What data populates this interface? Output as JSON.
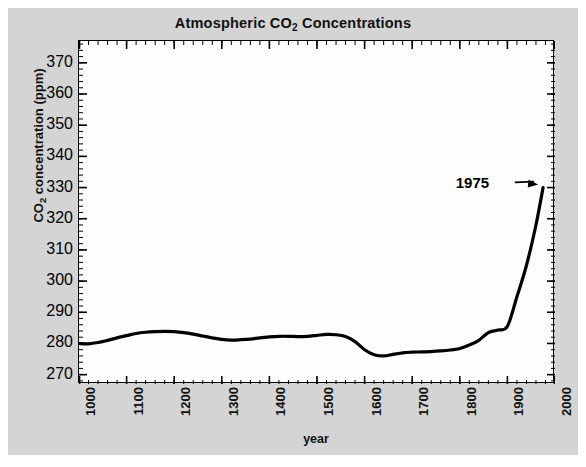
{
  "figure": {
    "background_color": "#d4d4d4",
    "plot_background_color": "#fdfdfd",
    "line_color": "#000000",
    "text_color": "#111111"
  },
  "title": {
    "prefix": "Atmospheric CO",
    "subscript": "2",
    "suffix": " Concentrations",
    "full": "Atmospheric CO2 Concentrations"
  },
  "ylabel": {
    "prefix": "CO",
    "subscript": "2",
    "suffix": " concentration (ppm)",
    "full": "CO2 concentration (ppm)"
  },
  "xlabel": "year",
  "annotation": {
    "label": "1975"
  },
  "chart_data": {
    "type": "line",
    "title": "Atmospheric CO2 Concentrations",
    "xlabel": "year",
    "ylabel": "CO2 concentration (ppm)",
    "xlim": [
      1000,
      2000
    ],
    "ylim": [
      267,
      377
    ],
    "xticks": [
      1000,
      1100,
      1200,
      1300,
      1400,
      1500,
      1600,
      1700,
      1800,
      1900,
      2000
    ],
    "xtick_labels": [
      "1000",
      "1100",
      "1200",
      "1300",
      "1400",
      "1500",
      "1600",
      "1700",
      "1800",
      "1900",
      "2000"
    ],
    "yticks": [
      270,
      280,
      290,
      300,
      310,
      320,
      330,
      340,
      350,
      360,
      370
    ],
    "ytick_labels": [
      "270",
      "280",
      "290",
      "300",
      "310",
      "320",
      "330",
      "340",
      "350",
      "360",
      "370"
    ],
    "minor_tick_interval_x": 20,
    "minor_tick_interval_y": 2,
    "grid": false,
    "legend": false,
    "line_width": 3.2,
    "annotations": [
      {
        "text": "1975",
        "text_x": 1905,
        "text_y": 331,
        "arrow_to_x": 1973,
        "arrow_to_y": 330
      }
    ],
    "series": [
      {
        "name": "CO2 concentration",
        "x": [
          1000,
          1020,
          1040,
          1060,
          1080,
          1100,
          1120,
          1140,
          1160,
          1180,
          1200,
          1220,
          1240,
          1260,
          1280,
          1300,
          1320,
          1340,
          1360,
          1380,
          1400,
          1420,
          1440,
          1460,
          1480,
          1500,
          1520,
          1540,
          1560,
          1580,
          1600,
          1620,
          1640,
          1660,
          1680,
          1700,
          1720,
          1740,
          1760,
          1780,
          1800,
          1820,
          1840,
          1860,
          1880,
          1900,
          1920,
          1940,
          1960,
          1975
        ],
        "y": [
          280.0,
          279.9,
          280.3,
          281.0,
          281.8,
          282.5,
          283.2,
          283.6,
          283.8,
          283.9,
          283.8,
          283.5,
          283.0,
          282.4,
          281.8,
          281.3,
          281.1,
          281.2,
          281.4,
          281.8,
          282.1,
          282.3,
          282.3,
          282.2,
          282.3,
          282.6,
          282.9,
          282.8,
          282.2,
          280.6,
          278.0,
          276.4,
          276.0,
          276.5,
          277.0,
          277.2,
          277.3,
          277.4,
          277.6,
          277.9,
          278.4,
          279.5,
          281.0,
          283.5,
          284.3,
          285.5,
          295.0,
          305.0,
          318.0,
          330.0
        ]
      }
    ]
  }
}
